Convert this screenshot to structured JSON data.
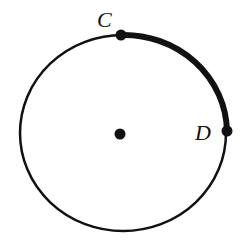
{
  "diagram": {
    "type": "circle-arc",
    "colors": {
      "stroke": "#111111",
      "background": "#ffffff"
    },
    "circle": {
      "cx": 123,
      "cy": 133,
      "rx": 103,
      "ry": 98,
      "stroke_width": 2.5
    },
    "center_point": {
      "x": 120,
      "y": 134,
      "r": 5.5
    },
    "points": [
      {
        "id": "C",
        "label": "C",
        "x": 121,
        "y": 35,
        "r": 5.5,
        "label_x": 97,
        "label_y": 27
      },
      {
        "id": "D",
        "label": "D",
        "x": 227,
        "y": 131,
        "r": 5.5,
        "label_x": 195,
        "label_y": 140
      }
    ],
    "highlighted_arc": {
      "from": "C",
      "to": "D",
      "stroke_width": 6
    }
  }
}
